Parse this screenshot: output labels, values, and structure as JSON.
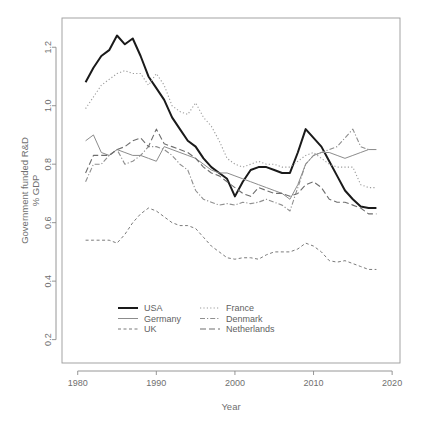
{
  "chart_data": {
    "type": "line",
    "title": "",
    "xlabel": "Year",
    "ylabel": "Government funded R&D\n% GDP",
    "ylabel_line1": "Government funded R&D",
    "ylabel_line2": "% GDP",
    "xlim": [
      1978,
      2021
    ],
    "ylim": [
      0.12,
      1.3
    ],
    "xticks": [
      1980,
      1990,
      2000,
      2010,
      2020
    ],
    "xtick_labels": [
      "1980",
      "1990",
      "2000",
      "2010",
      "2020"
    ],
    "yticks": [
      0.2,
      0.4,
      0.6,
      0.8,
      1.0,
      1.2
    ],
    "ytick_labels": [
      "0.2",
      "0.4",
      "0.6",
      "0.8",
      "1.0",
      "1.2"
    ],
    "grid": false,
    "legend_position": "bottom-center",
    "x": [
      1981,
      1982,
      1983,
      1984,
      1985,
      1986,
      1987,
      1988,
      1989,
      1990,
      1991,
      1992,
      1993,
      1994,
      1995,
      1996,
      1997,
      1998,
      1999,
      2000,
      2001,
      2002,
      2003,
      2004,
      2005,
      2006,
      2007,
      2008,
      2009,
      2010,
      2011,
      2012,
      2013,
      2014,
      2015,
      2016,
      2017,
      2018
    ],
    "series": [
      {
        "name": "USA",
        "color": "#1a1a1a",
        "style": "solid",
        "width": 2.0,
        "dash": "none",
        "values": [
          1.08,
          1.13,
          1.17,
          1.19,
          1.24,
          1.21,
          1.23,
          1.17,
          1.1,
          1.06,
          1.02,
          0.96,
          0.92,
          0.88,
          0.86,
          0.82,
          0.79,
          0.77,
          0.75,
          0.69,
          0.74,
          0.78,
          0.79,
          0.79,
          0.78,
          0.77,
          0.77,
          0.84,
          0.92,
          0.89,
          0.86,
          0.81,
          0.76,
          0.71,
          0.68,
          0.655,
          0.65,
          0.65
        ]
      },
      {
        "name": "Germany",
        "color": "#8c8c8c",
        "style": "solid",
        "width": 1.0,
        "dash": "none",
        "values": [
          0.88,
          0.9,
          0.84,
          0.83,
          0.85,
          0.84,
          0.83,
          0.83,
          0.82,
          0.81,
          0.86,
          0.85,
          0.84,
          0.83,
          0.82,
          0.8,
          0.78,
          0.77,
          0.77,
          0.76,
          0.75,
          0.74,
          0.73,
          0.72,
          0.71,
          0.7,
          0.68,
          0.73,
          0.8,
          0.83,
          0.84,
          0.84,
          0.83,
          0.82,
          0.83,
          0.84,
          0.85,
          0.85
        ]
      },
      {
        "name": "UK",
        "color": "#7a7a7a",
        "style": "dashed",
        "width": 1.0,
        "dash": "3,2.5",
        "values": [
          0.54,
          0.54,
          0.54,
          0.54,
          0.53,
          0.56,
          0.6,
          0.63,
          0.65,
          0.64,
          0.62,
          0.6,
          0.59,
          0.59,
          0.58,
          0.55,
          0.52,
          0.5,
          0.48,
          0.475,
          0.48,
          0.48,
          0.475,
          0.49,
          0.5,
          0.5,
          0.5,
          0.51,
          0.53,
          0.52,
          0.5,
          0.47,
          0.465,
          0.47,
          0.46,
          0.45,
          0.44,
          0.44
        ]
      },
      {
        "name": "France",
        "color": "#9c9c9c",
        "style": "dotted",
        "width": 1.1,
        "dash": "1.2,2.2",
        "values": [
          0.99,
          1.03,
          1.07,
          1.09,
          1.11,
          1.12,
          1.11,
          1.11,
          1.07,
          1.11,
          1.07,
          1.0,
          0.98,
          0.97,
          1.01,
          0.96,
          0.93,
          0.88,
          0.82,
          0.8,
          0.79,
          0.8,
          0.81,
          0.8,
          0.8,
          0.79,
          0.79,
          0.81,
          0.83,
          0.84,
          0.82,
          0.8,
          0.79,
          0.79,
          0.79,
          0.73,
          0.72,
          0.72
        ]
      },
      {
        "name": "Denmark",
        "color": "#8f8f8f",
        "style": "dash-dot",
        "width": 1.1,
        "dash": "5,2,1.2,2",
        "values": [
          0.74,
          0.8,
          0.8,
          0.83,
          0.85,
          0.8,
          0.81,
          0.83,
          0.86,
          0.86,
          0.85,
          0.83,
          0.8,
          0.78,
          0.71,
          0.68,
          0.67,
          0.66,
          0.665,
          0.66,
          0.67,
          0.665,
          0.67,
          0.68,
          0.67,
          0.66,
          0.64,
          0.72,
          0.8,
          0.83,
          0.84,
          0.85,
          0.86,
          0.89,
          0.92,
          0.86,
          0.85,
          0.85
        ]
      },
      {
        "name": "Netherlands",
        "color": "#6e6e6e",
        "style": "longdash",
        "width": 1.1,
        "dash": "6,3",
        "values": [
          0.77,
          0.83,
          0.83,
          0.83,
          0.85,
          0.86,
          0.88,
          0.89,
          0.86,
          0.92,
          0.87,
          0.86,
          0.85,
          0.84,
          0.82,
          0.79,
          0.77,
          0.76,
          0.74,
          0.72,
          0.7,
          0.69,
          0.72,
          0.71,
          0.7,
          0.7,
          0.69,
          0.7,
          0.73,
          0.74,
          0.72,
          0.68,
          0.67,
          0.67,
          0.66,
          0.65,
          0.63,
          0.63
        ]
      }
    ],
    "legend": {
      "column1": [
        {
          "name": "USA",
          "color": "#1a1a1a",
          "dash": "none",
          "width": 2.0
        },
        {
          "name": "Germany",
          "color": "#8c8c8c",
          "dash": "none",
          "width": 1.0
        },
        {
          "name": "UK",
          "color": "#7a7a7a",
          "dash": "3,2.5",
          "width": 1.0
        }
      ],
      "column2": [
        {
          "name": "France",
          "color": "#9c9c9c",
          "dash": "1.2,2.2",
          "width": 1.1
        },
        {
          "name": "Denmark",
          "color": "#8f8f8f",
          "dash": "5,2,1.2,2",
          "width": 1.1
        },
        {
          "name": "Netherlands",
          "color": "#6e6e6e",
          "dash": "6,3",
          "width": 1.1
        }
      ]
    }
  }
}
